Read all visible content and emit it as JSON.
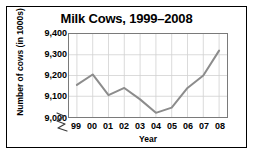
{
  "chart_data": {
    "type": "line",
    "title": "Milk Cows, 1999–2008",
    "xlabel": "Year",
    "ylabel": "Number of cows (in 1000s)",
    "categories": [
      "99",
      "00",
      "01",
      "02",
      "03",
      "04",
      "05",
      "06",
      "07",
      "08"
    ],
    "x_full_years": [
      1999,
      2000,
      2001,
      2002,
      2003,
      2004,
      2005,
      2006,
      2007,
      2008
    ],
    "values": [
      9155,
      9205,
      9105,
      9140,
      9085,
      9020,
      9045,
      9140,
      9200,
      9320
    ],
    "series": [
      {
        "name": "Number of cows",
        "values": [
          9155,
          9205,
          9105,
          9140,
          9085,
          9020,
          9045,
          9140,
          9200,
          9320
        ]
      }
    ],
    "ylim": [
      9000,
      9400
    ],
    "y_ticks": [
      9000,
      9100,
      9200,
      9300,
      9400
    ],
    "y_tick_labels": [
      "9,000",
      "9,100",
      "9,200",
      "9,300",
      "9,400"
    ],
    "grid": true,
    "legend": "none",
    "axis_break": "y-axis broken below 9,000",
    "line_color": "#8c8c8c",
    "grid_color": "#d2d2d2",
    "axis_color": "#7a7a7a",
    "text_color": "#000000",
    "background_color": "#ffffff"
  },
  "icons": {
    "axis_break": "axis-break-zigzag-icon"
  }
}
